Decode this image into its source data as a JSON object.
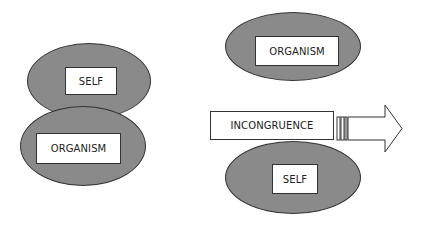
{
  "left_group": {
    "top_ellipse_label": "SELF",
    "bottom_ellipse_label": "ORGANISM"
  },
  "right_group": {
    "top_ellipse_label": "ORGANISM",
    "middle_label": "INCONGRUENCE",
    "bottom_ellipse_label": "SELF"
  },
  "colors": {
    "ellipse_fill": "#8a8a8a",
    "box_fill": "#ffffff",
    "outline": "#333333"
  }
}
